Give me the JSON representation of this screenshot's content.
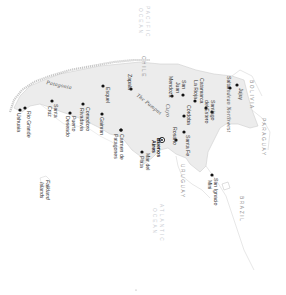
{
  "map": {
    "colors": {
      "land_argentina": "#ececec",
      "border": "#bdbdbd",
      "coast": "#cfcfcf",
      "dot": "#111111",
      "text": "#333333",
      "ocean_label": "#c9ccd2"
    },
    "oceans": [
      {
        "name": "PACIFIC",
        "line2": "OCEAN"
      },
      {
        "name": "ATLANTIC",
        "line2": "OCEAN"
      }
    ],
    "countries": [
      "CHILE",
      "BOLIVIA",
      "PARAGUAY",
      "URUGUAY",
      "BRAZIL"
    ],
    "regions": [
      "Patagonia",
      "The Pampas",
      "Cuyo",
      "Andean Northwest"
    ],
    "capital": {
      "name": "Buenos",
      "line2": "Aires",
      "icon": "capital-star-icon"
    },
    "cities": [
      {
        "name": "Ushuaia"
      },
      {
        "name": "Rio Grande"
      },
      {
        "name": "Santa",
        "line2": "Cruz"
      },
      {
        "name": "Puerto",
        "line2": "Deseado"
      },
      {
        "name": "Comodoro",
        "line2": "Rivadavia"
      },
      {
        "name": "Trelew"
      },
      {
        "name": "Gaiman"
      },
      {
        "name": "Esquel"
      },
      {
        "name": "Zapala"
      },
      {
        "name": "Carmen de",
        "line2": "Patagones"
      },
      {
        "name": "Mar del",
        "line2": "Plata"
      },
      {
        "name": "Rosario"
      },
      {
        "name": "Santa Fe"
      },
      {
        "name": "Córdoba"
      },
      {
        "name": "Mendoza"
      },
      {
        "name": "San",
        "line2": "Juan"
      },
      {
        "name": "La Rioja"
      },
      {
        "name": "Catamarca"
      },
      {
        "name": "Santiago",
        "line2": "del Estero"
      },
      {
        "name": "Salta"
      },
      {
        "name": "Jujuy"
      },
      {
        "name": "San Ignacio",
        "line2": "Mini"
      }
    ],
    "islands": [
      {
        "name": "Falkland",
        "line2": "Islands"
      }
    ]
  }
}
